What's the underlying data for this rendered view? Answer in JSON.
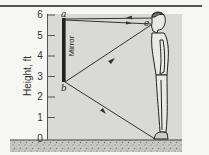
{
  "figure": {
    "y_axis": {
      "title": "Height, ft",
      "ticks": [
        "0",
        "1",
        "2",
        "3",
        "4",
        "5",
        "6"
      ]
    },
    "mirror": {
      "label": "Mirror",
      "top_point": "a",
      "bottom_point": "b"
    },
    "eye_point": "e",
    "colors": {
      "panel": "#d9d9d7",
      "background": "#f6f6f4",
      "lines": "#333333",
      "ground": "#bdbdbb"
    }
  }
}
